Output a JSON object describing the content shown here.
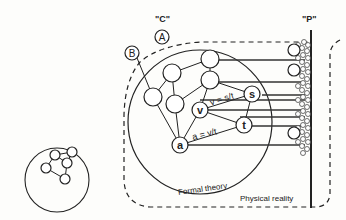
{
  "labels": {
    "concept_world": "\"C\"",
    "physical_world": "\"P\"",
    "node_a_outside": "A",
    "node_b_outside": "B",
    "formal_theory": "Formal theory",
    "physical_reality": "Physical reality",
    "eq_velocity": "v = s/t",
    "eq_accel": "a = v/t"
  },
  "nodes": {
    "s": "s",
    "v": "v",
    "t": "t",
    "a": "a"
  }
}
